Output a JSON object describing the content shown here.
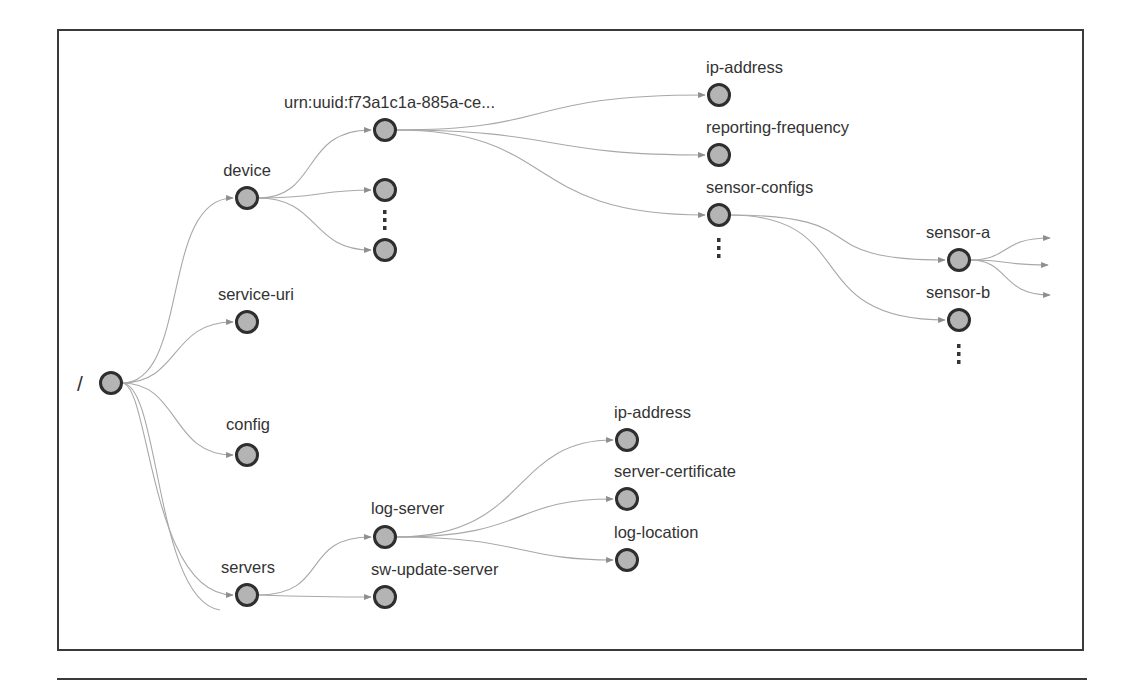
{
  "diagram": {
    "title": "",
    "colors": {
      "frame": "#3a3a3a",
      "node_fill": "#b4b4b4",
      "node_stroke": "#2e2e2e",
      "edge": "#a8a8a8",
      "label": "#333333"
    },
    "nodes": {
      "root": {
        "label": "/",
        "x": 111,
        "y": 383
      },
      "device": {
        "label": "device",
        "x": 247,
        "y": 198
      },
      "service_uri": {
        "label": "service-uri",
        "x": 247,
        "y": 322
      },
      "config": {
        "label": "config",
        "x": 247,
        "y": 455
      },
      "servers": {
        "label": "servers",
        "x": 247,
        "y": 595
      },
      "urn": {
        "label": "urn:uuid:f73a1c1a-885a-ce...",
        "x": 385,
        "y": 130
      },
      "device_child2": {
        "label": "",
        "x": 385,
        "y": 190
      },
      "device_child3": {
        "label": "",
        "x": 385,
        "y": 250
      },
      "ip_address_1": {
        "label": "ip-address",
        "x": 719,
        "y": 95
      },
      "reporting_frequency": {
        "label": "reporting-frequency",
        "x": 719,
        "y": 155
      },
      "sensor_configs": {
        "label": "sensor-configs",
        "x": 719,
        "y": 215
      },
      "sensor_a": {
        "label": "sensor-a",
        "x": 959,
        "y": 260
      },
      "sensor_b": {
        "label": "sensor-b",
        "x": 959,
        "y": 320
      },
      "log_server": {
        "label": "log-server",
        "x": 385,
        "y": 537
      },
      "sw_update_server": {
        "label": "sw-update-server",
        "x": 385,
        "y": 597
      },
      "ip_address_2": {
        "label": "ip-address",
        "x": 627,
        "y": 440
      },
      "server_certificate": {
        "label": "server-certificate",
        "x": 627,
        "y": 499
      },
      "log_location": {
        "label": "log-location",
        "x": 627,
        "y": 560
      }
    },
    "ellipsis_markers": [
      "device-children",
      "sensor-configs-children",
      "sensor-children"
    ],
    "edges": [
      [
        "/",
        "device"
      ],
      [
        "/",
        "service-uri"
      ],
      [
        "/",
        "config"
      ],
      [
        "/",
        "servers"
      ],
      [
        "device",
        "urn:uuid:f73a1c1a-885a-ce..."
      ],
      [
        "device",
        "(unnamed)"
      ],
      [
        "device",
        "(unnamed)"
      ],
      [
        "urn:uuid:f73a1c1a-885a-ce...",
        "ip-address"
      ],
      [
        "urn:uuid:f73a1c1a-885a-ce...",
        "reporting-frequency"
      ],
      [
        "urn:uuid:f73a1c1a-885a-ce...",
        "sensor-configs"
      ],
      [
        "sensor-configs",
        "sensor-a"
      ],
      [
        "sensor-configs",
        "sensor-b"
      ],
      [
        "sensor-a",
        "(out)"
      ],
      [
        "sensor-a",
        "(out)"
      ],
      [
        "sensor-a",
        "(out)"
      ],
      [
        "servers",
        "log-server"
      ],
      [
        "servers",
        "sw-update-server"
      ],
      [
        "log-server",
        "ip-address"
      ],
      [
        "log-server",
        "server-certificate"
      ],
      [
        "log-server",
        "log-location"
      ]
    ]
  }
}
